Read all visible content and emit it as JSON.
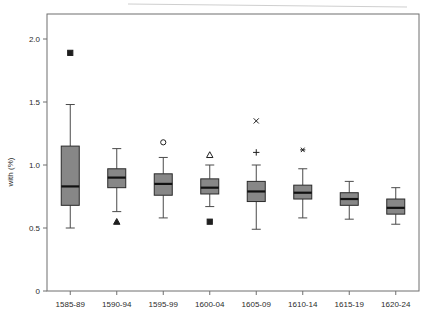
{
  "chart_data": {
    "type": "box",
    "title": "",
    "subtitle": "",
    "xlabel": "",
    "ylabel": "with (%)",
    "ylim": [
      0,
      2.15
    ],
    "grid": false,
    "legend": "none",
    "y_ticks": [
      {
        "value": 0,
        "label": "0"
      },
      {
        "value": 0.5,
        "label": "0.5"
      },
      {
        "value": 1.0,
        "label": "1.0"
      },
      {
        "value": 1.5,
        "label": "1.5"
      },
      {
        "value": 2.0,
        "label": "2.0"
      }
    ],
    "categories": [
      "1585-89",
      "1590-94",
      "1595-99",
      "1600-04",
      "1605-09",
      "1610-14",
      "1615-19",
      "1620-24"
    ],
    "boxes": [
      {
        "category": "1585-89",
        "whisker_low": 0.5,
        "q1": 0.68,
        "median": 0.83,
        "q3": 1.15,
        "whisker_high": 1.48,
        "outliers": [
          {
            "value": 1.89,
            "marker": "filled-square"
          }
        ]
      },
      {
        "category": "1590-94",
        "whisker_low": 0.63,
        "q1": 0.82,
        "median": 0.9,
        "q3": 0.97,
        "whisker_high": 1.13,
        "outliers": [
          {
            "value": 0.55,
            "marker": "filled-triangle"
          }
        ]
      },
      {
        "category": "1595-99",
        "whisker_low": 0.58,
        "q1": 0.76,
        "median": 0.85,
        "q3": 0.93,
        "whisker_high": 1.06,
        "outliers": [
          {
            "value": 1.18,
            "marker": "open-circle"
          }
        ]
      },
      {
        "category": "1600-04",
        "whisker_low": 0.67,
        "q1": 0.77,
        "median": 0.82,
        "q3": 0.89,
        "whisker_high": 1.0,
        "outliers": [
          {
            "value": 1.08,
            "marker": "open-triangle"
          },
          {
            "value": 0.55,
            "marker": "filled-square"
          }
        ]
      },
      {
        "category": "1605-09",
        "whisker_low": 0.49,
        "q1": 0.71,
        "median": 0.79,
        "q3": 0.87,
        "whisker_high": 1.0,
        "outliers": [
          {
            "value": 1.35,
            "marker": "cross-x"
          },
          {
            "value": 1.1,
            "marker": "plus"
          }
        ]
      },
      {
        "category": "1610-14",
        "whisker_low": 0.58,
        "q1": 0.73,
        "median": 0.78,
        "q3": 0.84,
        "whisker_high": 0.97,
        "outliers": [
          {
            "value": 1.12,
            "marker": "asterisk"
          }
        ]
      },
      {
        "category": "1615-19",
        "whisker_low": 0.57,
        "q1": 0.68,
        "median": 0.73,
        "q3": 0.78,
        "whisker_high": 0.87,
        "outliers": []
      },
      {
        "category": "1620-24",
        "whisker_low": 0.53,
        "q1": 0.61,
        "median": 0.66,
        "q3": 0.73,
        "whisker_high": 0.82,
        "outliers": []
      }
    ],
    "colors": {
      "box_fill": "#878787",
      "box_edge": "#2a2a2a",
      "median": "#111111",
      "whisker": "#4a4a4a",
      "axis": "#6f6f6f",
      "text": "#2b2b2b",
      "background": "#ffffff"
    }
  }
}
